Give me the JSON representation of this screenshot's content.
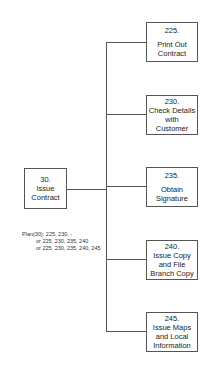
{
  "root": {
    "number": "30.",
    "label": "Issue\nContract"
  },
  "plan": {
    "line1": "Plan(30): 225, 230, -",
    "line2": "or 225, 230, 235, 240",
    "line3": "or 225, 230, 235, 240, 245"
  },
  "children": [
    {
      "number": "225.",
      "label": "Print Out\nContract"
    },
    {
      "number": "230.",
      "label": "Check Details\nwith\nCustomer"
    },
    {
      "number": "235.",
      "label": "Obtain\nSignature"
    },
    {
      "number": "240.",
      "label": "Issue Copy\nand File\nBranch Copy"
    },
    {
      "number": "245.",
      "label": "Issue Maps\nand Local\nInformation"
    }
  ]
}
